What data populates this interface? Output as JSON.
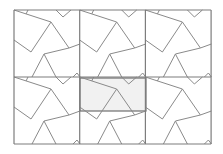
{
  "diagram": {
    "type": "tessellation",
    "grid": {
      "cols": 3,
      "rows": 2,
      "origin": [
        14,
        10
      ],
      "tile_w": 65.7,
      "tile_h": 67
    },
    "colors": {
      "background": "#ffffff",
      "line": "#8a8a8a",
      "grid": "#7d7d7d",
      "highlight_fill": "#f1f1f1",
      "highlight_stroke": "#6e6e6e"
    },
    "highlight": {
      "x": 80,
      "y": 78,
      "w": 66,
      "h": 33
    },
    "tile_paths": [
      "M0,0 L37,12 L55,38 L66,34",
      "M0,30 L17,42 L37,12",
      "M30,44 L55,38",
      "M30,44 L18,67",
      "M30,44 L42,67",
      "M42,0 L49,7 L57,0",
      "M59,67 L63,63 L66,67",
      "M14,0 L12,4"
    ]
  }
}
